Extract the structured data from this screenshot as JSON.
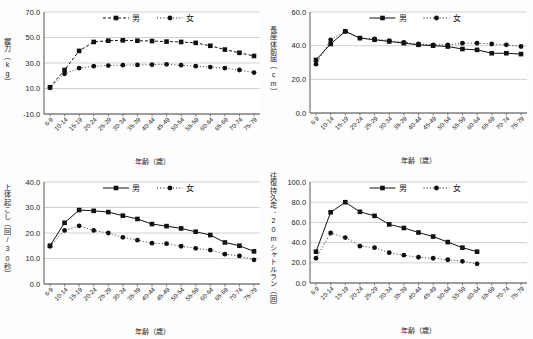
{
  "figure": {
    "panel_count": 4,
    "axis_label_x": "年齢（歳）",
    "legend": {
      "male": "男",
      "female": "女"
    }
  },
  "categories": [
    "6-9",
    "10-14",
    "15-19",
    "20-24",
    "25-29",
    "30-34",
    "35-39",
    "40-44",
    "45-49",
    "50-54",
    "55-59",
    "60-64",
    "65-69",
    "70-74",
    "75-79"
  ],
  "chart_data": [
    {
      "type": "line",
      "title": "",
      "ylabel": "握力（kg）",
      "xlabel": "年齢（歳）",
      "ylim": [
        -10.0,
        70.0
      ],
      "yticks": [
        "-10.0",
        "10.0",
        "30.0",
        "50.0",
        "70.0"
      ],
      "ytick_values": [
        -10.0,
        10.0,
        30.0,
        50.0,
        70.0
      ],
      "grid": true,
      "legend_position": "top-center",
      "categories": [
        "6-9",
        "10-14",
        "15-19",
        "20-24",
        "25-29",
        "30-34",
        "35-39",
        "40-44",
        "45-49",
        "50-54",
        "55-59",
        "60-64",
        "65-69",
        "70-74",
        "75-79"
      ],
      "series": [
        {
          "name": "男",
          "marker": "square",
          "line": "dashed",
          "values": [
            11.0,
            24.5,
            39.5,
            46.5,
            47.5,
            47.8,
            47.5,
            47.2,
            46.8,
            46.5,
            45.8,
            43.5,
            40.5,
            38.0,
            35.5
          ]
        },
        {
          "name": "女",
          "marker": "circle",
          "line": "dotted",
          "values": [
            10.5,
            21.5,
            26.0,
            27.5,
            28.0,
            28.3,
            28.5,
            28.7,
            29.0,
            28.3,
            27.5,
            26.8,
            26.0,
            24.5,
            22.5
          ]
        }
      ]
    },
    {
      "type": "line",
      "title": "",
      "ylabel": "長座体前屈（cm）",
      "xlabel": "年齢（歳）",
      "ylim": [
        0.0,
        60.0
      ],
      "yticks": [
        "0.0",
        "20.0",
        "40.0",
        "60.0"
      ],
      "ytick_values": [
        0.0,
        20.0,
        40.0,
        60.0
      ],
      "grid": true,
      "legend_position": "top-center",
      "categories": [
        "6-9",
        "10-14",
        "15-19",
        "20-24",
        "25-29",
        "30-34",
        "35-39",
        "40-44",
        "45-49",
        "50-54",
        "55-59",
        "60-64",
        "65-69",
        "70-74",
        "75-79"
      ],
      "series": [
        {
          "name": "男",
          "marker": "square",
          "line": "solid",
          "values": [
            31.5,
            41.0,
            48.5,
            44.5,
            43.5,
            42.5,
            41.5,
            40.5,
            40.0,
            39.5,
            38.0,
            37.5,
            35.5,
            35.5,
            35.0
          ]
        },
        {
          "name": "女",
          "marker": "circle",
          "line": "dotted",
          "values": [
            29.0,
            43.5,
            48.5,
            44.5,
            44.0,
            43.0,
            42.0,
            41.0,
            40.5,
            40.5,
            41.5,
            41.5,
            41.0,
            40.5,
            39.5
          ]
        }
      ]
    },
    {
      "type": "line",
      "title": "",
      "ylabel": "上体起こし（回/30秒）",
      "xlabel": "年齢（歳）",
      "ylim": [
        0.0,
        40.0
      ],
      "yticks": [
        "0.0",
        "10.0",
        "20.0",
        "30.0",
        "40.0"
      ],
      "ytick_values": [
        0.0,
        10.0,
        20.0,
        30.0,
        40.0
      ],
      "grid": true,
      "legend_position": "top-center",
      "categories": [
        "6-9",
        "10-14",
        "15-19",
        "20-24",
        "25-29",
        "30-34",
        "35-39",
        "40-44",
        "45-49",
        "50-54",
        "55-59",
        "60-64",
        "65-69",
        "70-74",
        "75-79"
      ],
      "series": [
        {
          "name": "男",
          "marker": "square",
          "line": "solid",
          "values": [
            15.0,
            24.0,
            29.0,
            28.7,
            28.2,
            26.8,
            25.5,
            23.5,
            22.7,
            21.8,
            20.5,
            19.2,
            16.3,
            15.0,
            12.8
          ]
        },
        {
          "name": "女",
          "marker": "circle",
          "line": "dotted",
          "values": [
            14.8,
            21.0,
            22.8,
            21.0,
            20.0,
            18.3,
            17.2,
            16.0,
            15.8,
            14.8,
            14.0,
            13.3,
            11.7,
            11.0,
            9.5
          ]
        }
      ]
    },
    {
      "type": "line",
      "title": "",
      "ylabel": "往復持久走：20mシャトルラン（回）",
      "xlabel": "年齢（歳）",
      "ylim": [
        0.0,
        100.0
      ],
      "yticks": [
        "0.0",
        "20.0",
        "40.0",
        "60.0",
        "80.0",
        "100.0"
      ],
      "ytick_values": [
        0.0,
        20.0,
        40.0,
        60.0,
        80.0,
        100.0
      ],
      "grid": true,
      "legend_position": "top-center",
      "categories": [
        "6-9",
        "10-14",
        "15-19",
        "20-24",
        "25-29",
        "30-34",
        "35-39",
        "40-44",
        "45-49",
        "50-54",
        "55-59",
        "60-64",
        "65-69",
        "70-74",
        "75-79"
      ],
      "series": [
        {
          "name": "男",
          "marker": "square",
          "line": "solid",
          "values": [
            31.0,
            70.0,
            80.0,
            70.5,
            66.5,
            58.0,
            54.5,
            50.0,
            46.0,
            40.5,
            35.0,
            31.0,
            null,
            null,
            null
          ]
        },
        {
          "name": "女",
          "marker": "circle",
          "line": "dotted",
          "values": [
            24.5,
            49.5,
            45.0,
            36.5,
            35.0,
            30.0,
            27.5,
            25.5,
            24.5,
            23.0,
            21.5,
            19.0,
            null,
            null,
            null
          ]
        }
      ]
    }
  ]
}
